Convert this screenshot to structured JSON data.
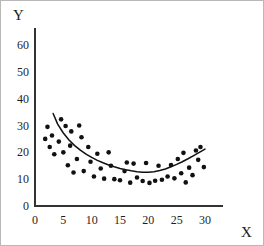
{
  "chart_data": {
    "type": "scatter",
    "title": "",
    "subtitle": "",
    "xlabel": "X",
    "ylabel": "Y",
    "xlim": [
      0,
      33
    ],
    "ylim": [
      0,
      66
    ],
    "xticks": [
      0,
      5,
      10,
      15,
      20,
      25,
      30
    ],
    "yticks": [
      0,
      10,
      20,
      30,
      40,
      50,
      60
    ],
    "xtick_labels": [
      "0",
      "5",
      "10",
      "15",
      "20",
      "25",
      "30"
    ],
    "ytick_labels": [
      "0",
      "10",
      "20",
      "30",
      "40",
      "50",
      "60"
    ],
    "grid": false,
    "legend": null,
    "marker": "filled-circle",
    "marker_color": "#111111",
    "marker_size_px": 3.4,
    "axis_color": "#333333",
    "curve_color": "#111111",
    "curve_label": "fitted quadratic trend curve",
    "curve_type": "quadratic",
    "curve_x_range": [
      3.2,
      30.0
    ],
    "curve_points": [
      {
        "x": 3.2,
        "y": 34.5
      },
      {
        "x": 4.0,
        "y": 30.5
      },
      {
        "x": 5.0,
        "y": 27.2
      },
      {
        "x": 6.0,
        "y": 24.6
      },
      {
        "x": 7.0,
        "y": 22.5
      },
      {
        "x": 8.0,
        "y": 20.8
      },
      {
        "x": 9.0,
        "y": 19.3
      },
      {
        "x": 10.0,
        "y": 18.1
      },
      {
        "x": 11.0,
        "y": 17.0
      },
      {
        "x": 12.0,
        "y": 16.1
      },
      {
        "x": 13.0,
        "y": 15.3
      },
      {
        "x": 14.0,
        "y": 14.6
      },
      {
        "x": 15.0,
        "y": 14.0
      },
      {
        "x": 16.0,
        "y": 13.5
      },
      {
        "x": 17.0,
        "y": 13.1
      },
      {
        "x": 18.0,
        "y": 12.8
      },
      {
        "x": 19.0,
        "y": 12.6
      },
      {
        "x": 20.0,
        "y": 12.6
      },
      {
        "x": 21.0,
        "y": 12.8
      },
      {
        "x": 22.0,
        "y": 13.2
      },
      {
        "x": 23.0,
        "y": 13.8
      },
      {
        "x": 24.0,
        "y": 14.6
      },
      {
        "x": 25.0,
        "y": 15.5
      },
      {
        "x": 26.0,
        "y": 16.5
      },
      {
        "x": 27.0,
        "y": 17.6
      },
      {
        "x": 28.0,
        "y": 18.8
      },
      {
        "x": 29.0,
        "y": 20.0
      },
      {
        "x": 30.0,
        "y": 21.2
      }
    ],
    "points": [
      {
        "x": 1.8,
        "y": 25.0
      },
      {
        "x": 2.2,
        "y": 29.5
      },
      {
        "x": 2.6,
        "y": 22.0
      },
      {
        "x": 3.0,
        "y": 26.3
      },
      {
        "x": 3.4,
        "y": 19.3
      },
      {
        "x": 4.2,
        "y": 24.0
      },
      {
        "x": 4.6,
        "y": 32.3
      },
      {
        "x": 5.0,
        "y": 20.0
      },
      {
        "x": 5.4,
        "y": 29.8
      },
      {
        "x": 5.8,
        "y": 15.2
      },
      {
        "x": 6.2,
        "y": 22.5
      },
      {
        "x": 6.4,
        "y": 27.8
      },
      {
        "x": 6.8,
        "y": 12.5
      },
      {
        "x": 7.4,
        "y": 17.5
      },
      {
        "x": 7.8,
        "y": 30.0
      },
      {
        "x": 8.2,
        "y": 25.6
      },
      {
        "x": 8.6,
        "y": 13.0
      },
      {
        "x": 9.4,
        "y": 22.0
      },
      {
        "x": 9.8,
        "y": 16.5
      },
      {
        "x": 10.4,
        "y": 11.0
      },
      {
        "x": 11.0,
        "y": 19.5
      },
      {
        "x": 11.6,
        "y": 14.0
      },
      {
        "x": 12.2,
        "y": 10.2
      },
      {
        "x": 13.0,
        "y": 20.0
      },
      {
        "x": 13.4,
        "y": 15.0
      },
      {
        "x": 14.0,
        "y": 10.0
      },
      {
        "x": 15.0,
        "y": 9.6
      },
      {
        "x": 15.8,
        "y": 13.0
      },
      {
        "x": 16.2,
        "y": 16.2
      },
      {
        "x": 16.8,
        "y": 8.7
      },
      {
        "x": 17.4,
        "y": 15.8
      },
      {
        "x": 18.0,
        "y": 10.6
      },
      {
        "x": 19.0,
        "y": 9.3
      },
      {
        "x": 19.6,
        "y": 16.0
      },
      {
        "x": 20.2,
        "y": 8.6
      },
      {
        "x": 21.2,
        "y": 9.4
      },
      {
        "x": 21.8,
        "y": 15.0
      },
      {
        "x": 22.4,
        "y": 9.8
      },
      {
        "x": 23.4,
        "y": 11.0
      },
      {
        "x": 24.0,
        "y": 15.3
      },
      {
        "x": 24.6,
        "y": 10.3
      },
      {
        "x": 25.2,
        "y": 17.5
      },
      {
        "x": 25.8,
        "y": 12.2
      },
      {
        "x": 26.2,
        "y": 19.8
      },
      {
        "x": 26.6,
        "y": 8.8
      },
      {
        "x": 27.2,
        "y": 14.3
      },
      {
        "x": 27.8,
        "y": 11.5
      },
      {
        "x": 28.4,
        "y": 20.7
      },
      {
        "x": 28.8,
        "y": 17.2
      },
      {
        "x": 29.2,
        "y": 22.0
      },
      {
        "x": 29.8,
        "y": 14.5
      }
    ]
  },
  "axis_titles": {
    "y": "Y",
    "x": "X"
  }
}
